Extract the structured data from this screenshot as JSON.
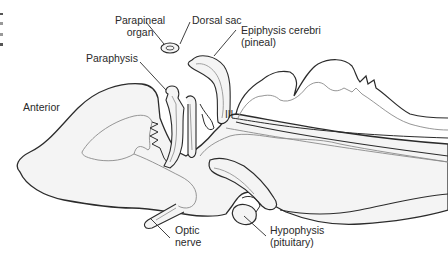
{
  "figure": {
    "type": "anatomical-diagram",
    "labels": {
      "parapineal": [
        "Parapineal",
        "organ"
      ],
      "dorsal_sac": "Dorsal sac",
      "epiphysis": [
        "Epiphysis cerebri",
        "(pineal)"
      ],
      "paraphysis": "Paraphysis",
      "anterior": "Anterior",
      "third_ventricle": "III",
      "optic_nerve": [
        "Optic",
        "nerve"
      ],
      "hypophysis": [
        "Hypophysis",
        "(pituitary)"
      ]
    },
    "colors": {
      "outline_dark": "#2b2b2b",
      "outline_light": "#8a8a8a",
      "fill": "#f4f4f4",
      "text": "#2a2a2a"
    }
  }
}
